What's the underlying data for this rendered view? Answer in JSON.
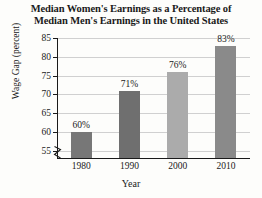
{
  "chart_data": {
    "type": "bar",
    "title": "Median Women's Earnings as a Percentage of Median Men's Earnings in the United States",
    "title_lines": [
      "Median Women's Earnings as a Percentage of",
      "Median Men's Earnings in the United States"
    ],
    "xlabel": "Year",
    "ylabel": "Wage Gap (percent)",
    "categories": [
      "1980",
      "1990",
      "2000",
      "2010"
    ],
    "values": [
      60,
      71,
      76,
      83
    ],
    "data_labels": [
      "60%",
      "71%",
      "76%",
      "83%"
    ],
    "ylim": [
      53,
      85
    ],
    "yticks": [
      55,
      60,
      65,
      70,
      75,
      80,
      85
    ],
    "ytick_labels": [
      "55",
      "60",
      "65",
      "70",
      "75",
      "80",
      "85"
    ],
    "grid": true,
    "legend": "none",
    "axis_break": true,
    "bar_colors": [
      "#777777",
      "#6f6f6f",
      "#ababab",
      "#8a8a8a"
    ],
    "axis_color": "#1a1a1a",
    "grid_color": "#d0d0d0",
    "background": "#fdfdfb"
  }
}
